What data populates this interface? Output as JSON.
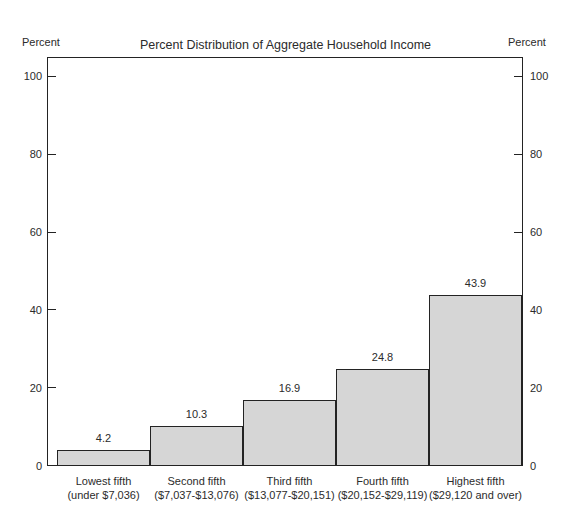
{
  "chart_data": {
    "type": "bar",
    "title": "Percent Distribution of Aggregate Household Income in 1979, by Fifths of Households",
    "title_lines": [
      "Percent Distribution of Aggregate Household Income",
      "in 1979, by Fifths of Households"
    ],
    "categories": [
      "Lowest fifth",
      "Second fifth",
      "Third fifth",
      "Fourth fifth",
      "Highest fifth"
    ],
    "category_ranges": [
      "(under $7,036)",
      "($7,037-$13,076)",
      "($13,077-$20,151)",
      "($20,152-$29,119)",
      "($29,120 and over)"
    ],
    "values": [
      4.2,
      10.3,
      16.9,
      24.8,
      43.9
    ],
    "value_labels": [
      "4.2",
      "10.3",
      "16.9",
      "24.8",
      "43.9"
    ],
    "xlabel": "",
    "ylabel": "Percent",
    "ylabel_right": "Percent",
    "ylim": [
      0,
      105
    ],
    "yticks": [
      0,
      20,
      40,
      60,
      80,
      100
    ],
    "ytick_labels": [
      "0",
      "20",
      "40",
      "60",
      "80",
      "100"
    ],
    "grid": false,
    "legend": null,
    "bar_fill_color": "#d6d6d6",
    "bar_edge_color": "#232323",
    "frame_color": "#232323",
    "background_color": "#ffffff"
  }
}
